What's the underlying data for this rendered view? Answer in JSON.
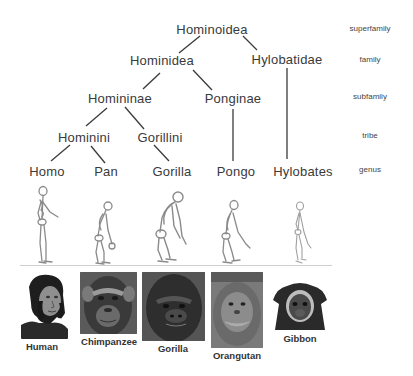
{
  "tree": {
    "nodes": [
      {
        "id": "hominoidea",
        "label": "Hominoidea",
        "x": 212,
        "y": 29
      },
      {
        "id": "hominidea",
        "label": "Hominidea",
        "x": 162,
        "y": 60
      },
      {
        "id": "hylobatidae",
        "label": "Hylobatidae",
        "x": 287,
        "y": 59
      },
      {
        "id": "homininae",
        "label": "Homininae",
        "x": 120,
        "y": 98
      },
      {
        "id": "ponginae",
        "label": "Ponginae",
        "x": 233,
        "y": 98
      },
      {
        "id": "hominini",
        "label": "Hominini",
        "x": 84,
        "y": 137
      },
      {
        "id": "gorillini",
        "label": "Gorillini",
        "x": 160,
        "y": 137
      },
      {
        "id": "homo",
        "label": "Homo",
        "x": 47,
        "y": 171
      },
      {
        "id": "pan",
        "label": "Pan",
        "x": 106,
        "y": 171
      },
      {
        "id": "gorilla",
        "label": "Gorilla",
        "x": 172,
        "y": 171
      },
      {
        "id": "pongo",
        "label": "Pongo",
        "x": 236,
        "y": 171
      },
      {
        "id": "hylobates",
        "label": "Hylobates",
        "x": 303,
        "y": 171
      }
    ],
    "edges": [
      {
        "from": "hominoidea",
        "to": "hominidea",
        "x1": 200,
        "y1": 36,
        "x2": 179,
        "y2": 53
      },
      {
        "from": "hominoidea",
        "to": "hylobatidae",
        "x1": 243,
        "y1": 36,
        "x2": 257,
        "y2": 50
      },
      {
        "from": "hominidea",
        "to": "homininae",
        "x1": 160,
        "y1": 73,
        "x2": 143,
        "y2": 89
      },
      {
        "from": "hominidea",
        "to": "ponginae",
        "x1": 193,
        "y1": 70,
        "x2": 212,
        "y2": 90
      },
      {
        "from": "hylobatidae",
        "to": "hylobates",
        "x1": 287,
        "y1": 68,
        "x2": 287,
        "y2": 159
      },
      {
        "from": "homininae",
        "to": "hominini",
        "x1": 107,
        "y1": 108,
        "x2": 86,
        "y2": 126
      },
      {
        "from": "homininae",
        "to": "gorillini",
        "x1": 125,
        "y1": 107,
        "x2": 144,
        "y2": 129
      },
      {
        "from": "ponginae",
        "to": "pongo",
        "x1": 233,
        "y1": 109,
        "x2": 233,
        "y2": 161
      },
      {
        "from": "hominini",
        "to": "homo",
        "x1": 70,
        "y1": 145,
        "x2": 51,
        "y2": 161
      },
      {
        "from": "hominini",
        "to": "pan",
        "x1": 91,
        "y1": 146,
        "x2": 105,
        "y2": 163
      },
      {
        "from": "gorillini",
        "to": "gorilla",
        "x1": 154,
        "y1": 145,
        "x2": 169,
        "y2": 161
      }
    ],
    "line_color": "#3a3a3a"
  },
  "ranks": [
    {
      "label": "superfamily",
      "x": 370,
      "y": 28
    },
    {
      "label": "family",
      "x": 370,
      "y": 59
    },
    {
      "label": "subfamily",
      "x": 370,
      "y": 96
    },
    {
      "label": "tribe",
      "x": 370,
      "y": 135
    },
    {
      "label": "genus",
      "x": 370,
      "y": 169
    }
  ],
  "skeletons": [
    {
      "name": "human",
      "x": 43,
      "height": 80,
      "posture": "upright"
    },
    {
      "name": "chimpanzee",
      "x": 105,
      "height": 63,
      "posture": "stooped"
    },
    {
      "name": "gorilla",
      "x": 172,
      "height": 75,
      "posture": "knuckle"
    },
    {
      "name": "orangutan",
      "x": 232,
      "height": 66,
      "posture": "stooped"
    },
    {
      "name": "gibbon",
      "x": 300,
      "height": 62,
      "posture": "upright"
    }
  ],
  "ground_line": {
    "x1": 20,
    "x2": 332,
    "y": 265,
    "color": "#cfcfcf"
  },
  "photos": [
    {
      "label": "Human",
      "x": 21,
      "y": 273,
      "w": 47,
      "h": 66,
      "label_x": 42,
      "label_y": 341,
      "tone": "#555"
    },
    {
      "label": "Chimpanzee",
      "x": 80,
      "y": 272,
      "w": 57,
      "h": 62,
      "label_x": 109,
      "label_y": 336,
      "tone": "#4a4a4a"
    },
    {
      "label": "Gorilla",
      "x": 142,
      "y": 272,
      "w": 63,
      "h": 69,
      "label_x": 173,
      "label_y": 343,
      "tone": "#3c3c3c"
    },
    {
      "label": "Orangutan",
      "x": 211,
      "y": 272,
      "w": 52,
      "h": 76,
      "label_x": 237,
      "label_y": 350,
      "tone": "#6a6a6a"
    },
    {
      "label": "Gibbon",
      "x": 273,
      "y": 280,
      "w": 54,
      "h": 50,
      "label_x": 300,
      "label_y": 333,
      "tone": "#2e2e2e"
    }
  ]
}
